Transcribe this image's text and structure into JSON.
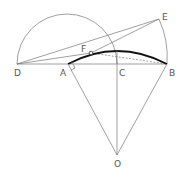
{
  "diagram": {
    "labels": {
      "D": "D",
      "A": "A",
      "C": "C",
      "B": "B",
      "E": "E",
      "F": "F",
      "O": "O"
    },
    "colors": {
      "line": "#666666",
      "arc_bold": "#111111",
      "background": "#ffffff"
    }
  }
}
